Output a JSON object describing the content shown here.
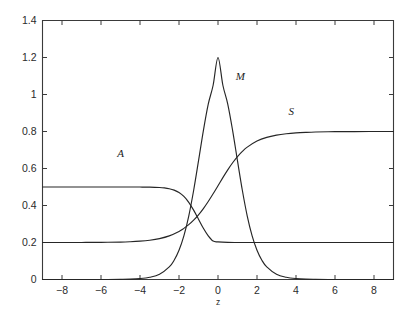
{
  "figure": {
    "background_color": "#ffffff",
    "axis_color": "#3a3a3a",
    "curve_color": "#262626"
  },
  "chart_data": {
    "type": "line",
    "title": "",
    "subtitle": "",
    "xlabel": "z",
    "ylabel": "",
    "xlim": [
      -9,
      9
    ],
    "ylim": [
      0,
      1.4
    ],
    "grid": false,
    "legend": "inline-annotations",
    "xticks": [
      -8,
      -6,
      -4,
      -2,
      0,
      2,
      4,
      6,
      8
    ],
    "xticklabels": [
      "-8",
      "-6",
      "-4",
      "-2",
      "0",
      "2",
      "4",
      "6",
      "8"
    ],
    "yticks": [
      0,
      0.2,
      0.4,
      0.6,
      0.8,
      1,
      1.2,
      1.4
    ],
    "yticklabels": [
      "0",
      "0.2",
      "0.4",
      "0.6",
      "0.8",
      "1",
      "1.2",
      "1.4"
    ],
    "annotations": [
      {
        "text": "A",
        "x": -5.0,
        "y": 0.66
      },
      {
        "text": "M",
        "x": 1.15,
        "y": 1.08
      },
      {
        "text": "S",
        "x": 3.75,
        "y": 0.89
      }
    ],
    "series": [
      {
        "name": "A",
        "label": "A",
        "description": "Decreasing sigmoid from plateau 0.5 to plateau 0.2",
        "left_plateau": 0.5,
        "right_plateau": 0.2,
        "midpoint": -1.45,
        "steepness": 2.6,
        "x": [
          -9,
          -8.5,
          -8,
          -7.5,
          -7,
          -6.5,
          -6,
          -5.5,
          -5,
          -4.5,
          -4,
          -3.5,
          -3,
          -2.75,
          -2.5,
          -2.25,
          -2,
          -1.75,
          -1.5,
          -1.25,
          -1,
          -0.75,
          -0.5,
          -0.25,
          0,
          0.5,
          1,
          1.5,
          2,
          3,
          4,
          5,
          6,
          7,
          8,
          9
        ],
        "y": [
          0.5,
          0.5,
          0.5,
          0.5,
          0.5,
          0.5,
          0.5,
          0.5,
          0.5,
          0.4999,
          0.4998,
          0.4993,
          0.4975,
          0.4952,
          0.4908,
          0.4832,
          0.4701,
          0.4489,
          0.4172,
          0.3748,
          0.3256,
          0.2767,
          0.2359,
          0.2075,
          0.2033,
          0.2005,
          0.2001,
          0.2,
          0.2,
          0.2,
          0.2,
          0.2,
          0.2,
          0.2,
          0.2,
          0.2
        ]
      },
      {
        "name": "M",
        "label": "M",
        "description": "Gaussian-like peak centered at z=0 with maximum 1.2",
        "peak_value": 1.2,
        "peak_x": 0,
        "baseline": 0.0,
        "x": [
          -9,
          -8,
          -7,
          -6,
          -5,
          -4.5,
          -4,
          -3.5,
          -3,
          -2.5,
          -2.25,
          -2,
          -1.75,
          -1.5,
          -1.25,
          -1,
          -0.75,
          -0.5,
          -0.25,
          0,
          0.25,
          0.5,
          0.75,
          1,
          1.25,
          1.5,
          1.75,
          2,
          2.25,
          2.5,
          3,
          3.5,
          4,
          4.5,
          5,
          6,
          7,
          8,
          9
        ],
        "y": [
          0.0,
          0.0,
          0.0,
          0.0,
          0.001,
          0.002,
          0.005,
          0.012,
          0.028,
          0.068,
          0.104,
          0.158,
          0.236,
          0.343,
          0.481,
          0.641,
          0.805,
          0.948,
          1.05,
          1.2,
          1.05,
          0.948,
          0.805,
          0.641,
          0.481,
          0.343,
          0.236,
          0.158,
          0.104,
          0.068,
          0.028,
          0.012,
          0.005,
          0.002,
          0.001,
          0.0,
          0.0,
          0.0,
          0.0
        ]
      },
      {
        "name": "S",
        "label": "S",
        "description": "Increasing sigmoid from plateau 0.2 to plateau 0.8",
        "left_plateau": 0.2,
        "right_plateau": 0.8,
        "midpoint": 0.55,
        "steepness": 1.25,
        "x": [
          -9,
          -8,
          -7,
          -6,
          -5,
          -4.5,
          -4,
          -3.5,
          -3,
          -2.5,
          -2,
          -1.75,
          -1.5,
          -1.25,
          -1,
          -0.75,
          -0.5,
          -0.25,
          0,
          0.25,
          0.5,
          0.75,
          1,
          1.25,
          1.5,
          2,
          2.5,
          3,
          3.5,
          4,
          4.5,
          5,
          6,
          7,
          8,
          9
        ],
        "y": [
          0.2,
          0.2,
          0.2002,
          0.2007,
          0.2024,
          0.2042,
          0.2072,
          0.2124,
          0.2212,
          0.2358,
          0.2597,
          0.2762,
          0.2963,
          0.3207,
          0.3497,
          0.3835,
          0.4216,
          0.4632,
          0.5069,
          0.5507,
          0.5927,
          0.631,
          0.6645,
          0.6926,
          0.7155,
          0.7483,
          0.7683,
          0.7802,
          0.7878,
          0.7925,
          0.7954,
          0.7972,
          0.799,
          0.7997,
          0.7999,
          0.8
        ]
      }
    ]
  }
}
